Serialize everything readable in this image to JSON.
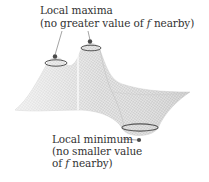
{
  "figure": {
    "colors": {
      "surface_fill": "#e2e2e2",
      "mesh_line": "#b5b5b5",
      "ring": "#555555",
      "dot": "#4a4a4a",
      "text": "#333333"
    }
  },
  "annotations": {
    "maxima": {
      "title": "Local maxima",
      "line2_prefix": "(no greater value of ",
      "line2_var": "f",
      "line2_suffix": " nearby)"
    },
    "minimum": {
      "title": "Local minimum",
      "line2": "(no smaller value",
      "line3_prefix": "of ",
      "line3_var": "f",
      "line3_suffix": " nearby)"
    }
  }
}
